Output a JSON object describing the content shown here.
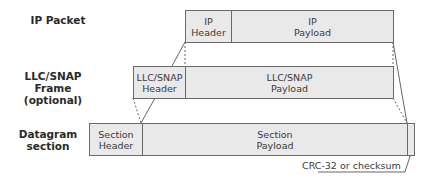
{
  "rows": [
    {
      "label": "IP Packet",
      "header": "IP\nHeader",
      "payload": "IP\nPayload"
    },
    {
      "label": "LLC/SNAP Frame\n(optional)",
      "header": "LLC/SNAP\nHeader",
      "payload": "LLC/SNAP\nPayload"
    },
    {
      "label": "Datagram\nsection",
      "header": "Section\nHeader",
      "payload": "Section\nPayload"
    }
  ],
  "annotation": "CRC-32 or checksum"
}
